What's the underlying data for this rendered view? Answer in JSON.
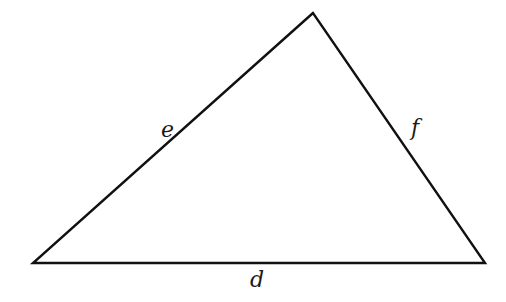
{
  "diagram": {
    "type": "triangle",
    "stroke_color": "#111111",
    "vertices": {
      "apex": [
        313,
        13
      ],
      "bottom_left": [
        33,
        263
      ],
      "bottom_right": [
        485,
        263
      ]
    },
    "sides": [
      {
        "label": "e",
        "position": "left side"
      },
      {
        "label": "f",
        "position": "right side"
      },
      {
        "label": "d",
        "position": "bottom side"
      }
    ]
  }
}
